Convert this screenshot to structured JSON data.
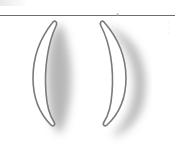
{
  "figure": {
    "rule_color": "#6d6d6d",
    "rule_mark": "a",
    "outline_color": "#7a7a7a",
    "fill_color": "#ffffff",
    "shadow_color": "#b8b8b8",
    "side_text": "· · ·",
    "shapes": [
      {
        "name": "left-crescent",
        "orientation": "opening-right"
      },
      {
        "name": "right-crescent",
        "orientation": "opening-left"
      }
    ]
  }
}
